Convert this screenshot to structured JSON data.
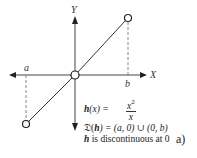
{
  "diagram": {
    "axes": {
      "x_label": "X",
      "y_label": "Y"
    },
    "points": {
      "a_label": "a",
      "b_label": "b"
    },
    "colors": {
      "line": "#333333",
      "dashed": "#888888",
      "background": "#ffffff"
    },
    "open_circles": [
      {
        "name": "origin",
        "cx": 75,
        "cy": 75
      },
      {
        "name": "upper-right-endpoint",
        "cx": 128,
        "cy": 18
      },
      {
        "name": "lower-left-endpoint",
        "cx": 26,
        "cy": 124
      }
    ]
  },
  "caption": {
    "function_name": "h",
    "function_arg": "(x) = ",
    "numerator": "x",
    "numerator_exp": "2",
    "denominator": "x",
    "domain_symbol": "𝔇(",
    "domain_fn": "h",
    "domain_rest": ") = (a, 0) ∪ (0, b)",
    "discontinuity_fn": "h",
    "discontinuity_rest": " is discontinuous at 0",
    "panel_label": "a)"
  }
}
